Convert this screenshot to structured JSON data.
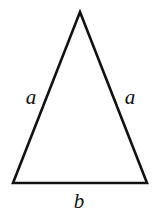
{
  "figure": {
    "name": "isosceles-triangle-labeled",
    "background_color": "#ffffff",
    "stroke_color": "#111111",
    "stroke_width": 2.6,
    "width": 157,
    "height": 217
  },
  "chart_data": {
    "type": "diagram",
    "shape": "isosceles triangle",
    "title": "",
    "vertices": [
      {
        "name": "apex",
        "x": 80,
        "y": 12
      },
      {
        "name": "bottom-right",
        "x": 147,
        "y": 183
      },
      {
        "name": "bottom-left",
        "x": 13,
        "y": 183
      }
    ],
    "edges": [
      {
        "name": "left-leg",
        "from": "apex",
        "to": "bottom-left",
        "label": "a"
      },
      {
        "name": "right-leg",
        "from": "apex",
        "to": "bottom-right",
        "label": "a"
      },
      {
        "name": "base",
        "from": "bottom-left",
        "to": "bottom-right",
        "label": "b"
      }
    ],
    "annotations": [
      {
        "text": "a",
        "x": 31,
        "y": 97,
        "style": "italic-serif"
      },
      {
        "text": "a",
        "x": 130,
        "y": 97,
        "style": "italic-serif"
      },
      {
        "text": "b",
        "x": 79,
        "y": 201,
        "style": "italic-serif"
      }
    ]
  },
  "labels": {
    "left_leg": "a",
    "right_leg": "a",
    "base": "b"
  },
  "geometry": {
    "polygon_points": "80,12 147,183 13,183"
  }
}
